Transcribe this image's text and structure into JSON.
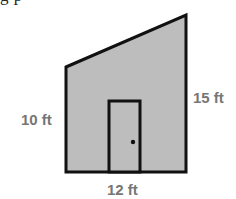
{
  "header": {
    "cropped_caption": "g p"
  },
  "figure": {
    "colors": {
      "fill": "#bdbdbd",
      "outline": "#111111",
      "label": "#767676",
      "door_knob": "#111111"
    },
    "labels": {
      "left_height": "10 ft",
      "right_height": "15 ft",
      "base_width": "12 ft"
    }
  }
}
